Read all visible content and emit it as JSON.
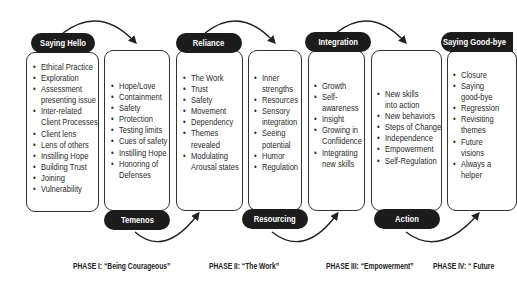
{
  "diagram": {
    "stages": [
      {
        "label": "Saying Hello",
        "label_position": "top",
        "items": [
          "Ethical Practice",
          "Exploration",
          "Assessment",
          "  presenting issue",
          "Inter-related",
          "  Client Processes",
          "Client lens",
          "Lens of others",
          "Instilling Hope",
          "Building Trust",
          "Joining",
          "Vulnerability"
        ]
      },
      {
        "label": "Temenos",
        "label_position": "bottom",
        "items": [
          "Hope/Love",
          "Containment",
          "Safety",
          "Protection",
          "Testing limits",
          "Cues of safety",
          "Instilling Hope",
          "Honoring of",
          "  Defenses"
        ]
      },
      {
        "label": "Reliance",
        "label_position": "top",
        "items": [
          "The Work",
          "Trust",
          "Safety",
          "Movement",
          "Dependency",
          "Themes",
          "  revealed",
          "Modulating",
          "  Arousal states"
        ]
      },
      {
        "label": "Resourcing",
        "label_position": "bottom",
        "items": [
          "Inner",
          "  strengths",
          "Resources",
          "Sensory",
          "  integration",
          "Seeing",
          "  potential",
          "Humor",
          "Regulation"
        ]
      },
      {
        "label": "Integration",
        "label_position": "top",
        "items": [
          "Growth",
          "Self-",
          "  awareness",
          "Insight",
          "Growing in",
          "  Confiidence",
          "Integrating",
          "  new skills"
        ]
      },
      {
        "label": "Action",
        "label_position": "bottom",
        "items": [
          "New skills",
          "  into action",
          "New behaviors",
          "Steps of Change",
          "Independence",
          "Empowerment",
          "Self-Regulation"
        ]
      },
      {
        "label": "Saying Good-bye",
        "label_position": "top",
        "items": [
          "Closure",
          "Saying",
          "  good-bye",
          "Regression",
          "Revisiting",
          "  themes",
          "Future",
          "  visions",
          "Always a",
          "  helper"
        ]
      }
    ],
    "phases": [
      "PHASE I: “Being Courageous”",
      "PHASE II: “The Work”",
      "PHASE III: “Empowerment”",
      "PHASE IV:  “ Future"
    ],
    "colors": {
      "label_bg": "#1c1c1c",
      "label_text": "#ffffff",
      "border": "#333333",
      "background": "#ffffff"
    }
  }
}
